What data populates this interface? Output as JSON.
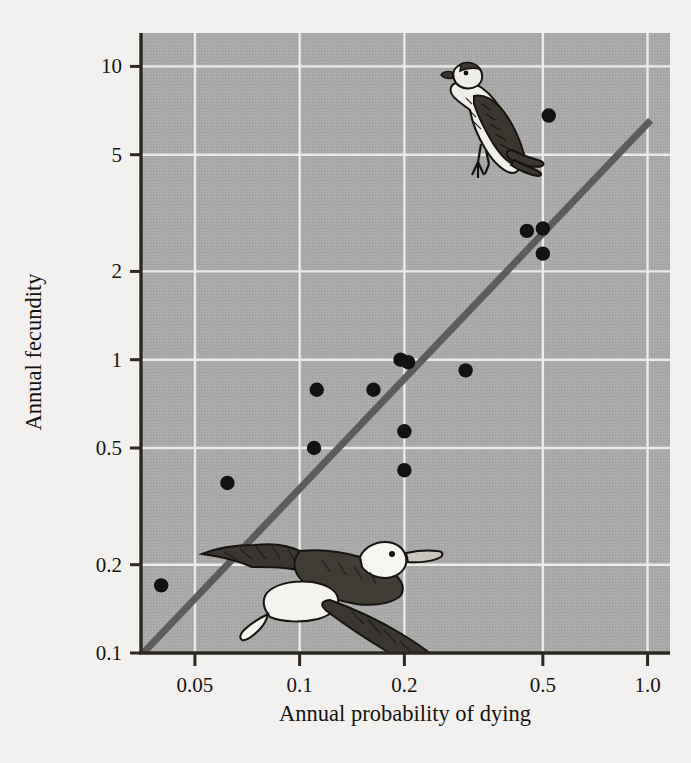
{
  "figure": {
    "background_color": "#f2f1ef",
    "plot_background_color": "#a9a9a9",
    "gridline_color": "#f0f0ee",
    "axis_color": "#2b2722",
    "point_color": "#121212",
    "trendline_color": "#5e5c5a"
  },
  "chart_data": {
    "type": "scatter",
    "title": "",
    "xlabel": "Annual probability of dying",
    "ylabel": "Annual fecundity",
    "xscale": "log",
    "yscale": "log",
    "xlim": [
      0.035,
      1.16
    ],
    "ylim": [
      0.1,
      13.0
    ],
    "grid": true,
    "legend": "none",
    "xticks": [
      0.05,
      0.1,
      0.2,
      0.5,
      1.0
    ],
    "xticklabels": [
      "0.05",
      "0.1",
      "0.2",
      "0.5",
      "1.0"
    ],
    "yticks": [
      0.1,
      0.2,
      0.5,
      1,
      2,
      5,
      10
    ],
    "yticklabels": [
      "0.1",
      "0.2",
      "0.5",
      "1",
      "2",
      "5",
      "10"
    ],
    "points": [
      {
        "x": 0.52,
        "y": 6.8
      },
      {
        "x": 0.45,
        "y": 2.75
      },
      {
        "x": 0.5,
        "y": 2.8
      },
      {
        "x": 0.5,
        "y": 2.3
      },
      {
        "x": 0.3,
        "y": 0.92
      },
      {
        "x": 0.195,
        "y": 1.0
      },
      {
        "x": 0.205,
        "y": 0.98
      },
      {
        "x": 0.163,
        "y": 0.79
      },
      {
        "x": 0.112,
        "y": 0.79
      },
      {
        "x": 0.2,
        "y": 0.57
      },
      {
        "x": 0.2,
        "y": 0.42
      },
      {
        "x": 0.11,
        "y": 0.5
      },
      {
        "x": 0.062,
        "y": 0.38
      },
      {
        "x": 0.04,
        "y": 0.17
      }
    ],
    "trendline": {
      "type": "linear-on-log-log",
      "x_start": 0.0355,
      "y_start": 0.1,
      "x_end": 1.02,
      "y_end": 6.55
    },
    "annotations": [
      {
        "name": "perched-passerine-bird",
        "description": "Perched small songbird illustration, high fecundity / high mortality region"
      },
      {
        "name": "flying-shearwater-bird",
        "description": "Flying shearwater illustration, low fecundity / low mortality region"
      }
    ]
  }
}
